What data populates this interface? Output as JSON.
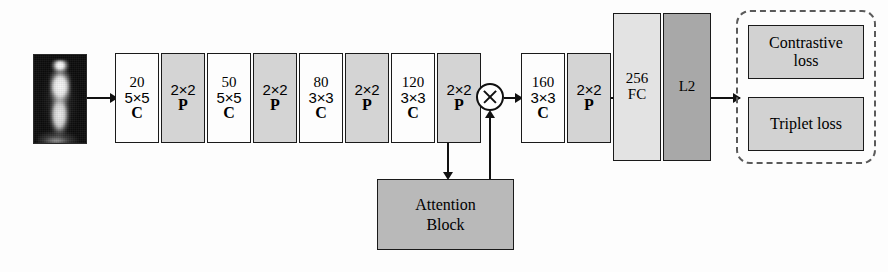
{
  "diagram": {
    "input": {
      "name": "thermal person image",
      "alt": "Infrared silhouette of a standing person"
    },
    "layers": [
      {
        "id": "conv1",
        "num": "20",
        "kernel": "5×5",
        "tag": "C",
        "kind": "conv"
      },
      {
        "id": "pool1",
        "num": "",
        "kernel": "2×2",
        "tag": "P",
        "kind": "pool"
      },
      {
        "id": "conv2",
        "num": "50",
        "kernel": "5×5",
        "tag": "C",
        "kind": "conv"
      },
      {
        "id": "pool2",
        "num": "",
        "kernel": "2×2",
        "tag": "P",
        "kind": "pool"
      },
      {
        "id": "conv3",
        "num": "80",
        "kernel": "3×3",
        "tag": "C",
        "kind": "conv"
      },
      {
        "id": "pool3",
        "num": "",
        "kernel": "2×2",
        "tag": "P",
        "kind": "pool"
      },
      {
        "id": "conv4",
        "num": "120",
        "kernel": "3×3",
        "tag": "C",
        "kind": "conv"
      },
      {
        "id": "pool4",
        "num": "",
        "kernel": "2×2",
        "tag": "P",
        "kind": "pool"
      },
      {
        "id": "conv5",
        "num": "160",
        "kernel": "3×3",
        "tag": "C",
        "kind": "conv"
      },
      {
        "id": "pool5",
        "num": "",
        "kernel": "2×2",
        "tag": "P",
        "kind": "pool"
      }
    ],
    "multiply_node": {
      "symbol": "⊗",
      "name": "element-wise multiplication"
    },
    "attention_block": {
      "line1": "Attention",
      "line2": "Block"
    },
    "fc": {
      "num": "256",
      "label": "FC"
    },
    "l2": {
      "label": "L2"
    },
    "losses": [
      {
        "id": "contrastive",
        "line1": "Contrastive",
        "line2": "loss"
      },
      {
        "id": "triplet",
        "line1": "Triplet loss",
        "line2": ""
      }
    ],
    "colors": {
      "conv_fill": "#fdfdfd",
      "pool_fill": "#d4d4d4",
      "fc_fill": "#e3e3e3",
      "l2_fill": "#a8a8a8",
      "attention_fill": "#b9b9b9",
      "loss_fill": "#d2d2d2",
      "stroke": "#1a1a1a",
      "dashed_stroke": "#5a5a5a",
      "background": "#fdfdfd"
    }
  }
}
